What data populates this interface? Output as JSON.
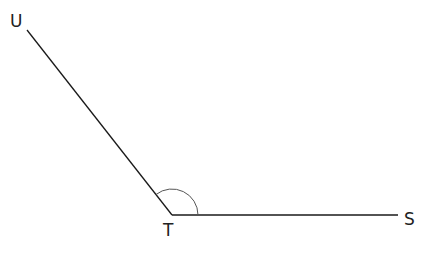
{
  "diagram": {
    "type": "angle",
    "angle_name": "UTS",
    "angle_kind": "obtuse",
    "points": {
      "U": {
        "label": "U",
        "x": 27,
        "y": 30
      },
      "T": {
        "label": "T",
        "x": 172,
        "y": 215
      },
      "S": {
        "label": "S",
        "x": 398,
        "y": 215
      }
    },
    "rays": [
      {
        "from": "T",
        "to": "U"
      },
      {
        "from": "T",
        "to": "S"
      }
    ],
    "arc": {
      "center": "T",
      "radius": 26
    },
    "colors": {
      "line": "#1a1a1a",
      "arc": "#555555",
      "label": "#222222"
    }
  }
}
